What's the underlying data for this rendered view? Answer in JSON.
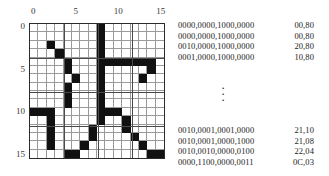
{
  "figure": {
    "name": "bitmap-grid-with-hex-encoding",
    "grid": {
      "columns": 16,
      "rows": 16,
      "top_axis_labels": [
        "0",
        "5",
        "10",
        "15"
      ],
      "top_axis_positions": [
        0,
        5,
        10,
        15
      ],
      "left_axis_labels": [
        "0",
        "5",
        "10",
        "15"
      ],
      "left_axis_positions": [
        0,
        5,
        10,
        15
      ],
      "filled_color": "#111111",
      "gridline_color": "#9a9a9a",
      "border_color": "#2b2b2b",
      "rows_bits": [
        "0000000010000000",
        "0000000010000000",
        "0010000010000000",
        "0001000010000000",
        "0000100011111110",
        "0000100010000010",
        "0000010010000100",
        "0000100010000000",
        "0000100010000000",
        "0000100010000000",
        "1110000011100000",
        "0010000010010000",
        "0010000100010000",
        "0010000100001000",
        "0010001000000100",
        "0000110000000011"
      ]
    },
    "listing": {
      "top_rows": [
        {
          "bits": "0000,0000,1000,0000",
          "hex": "00,80"
        },
        {
          "bits": "0000,0000,1000,0000",
          "hex": "00,80"
        },
        {
          "bits": "0010,0000,1000,0000",
          "hex": "20,80"
        },
        {
          "bits": "0001,0000,1000,0000",
          "hex": "10,80"
        }
      ],
      "ellipsis": "vertical-dots",
      "bottom_rows": [
        {
          "bits": "0010,0001,0001,0000",
          "hex": "21,10"
        },
        {
          "bits": "0010,0001,0000,1000",
          "hex": "21,08"
        },
        {
          "bits": "0010,0010,0000,0100",
          "hex": "22,04"
        },
        {
          "bits": "0000,1100,0000,0011",
          "hex": "0C,03"
        }
      ]
    }
  }
}
